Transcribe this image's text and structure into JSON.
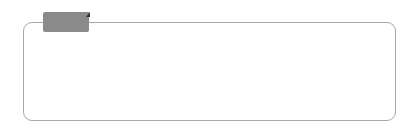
{
  "label": "보기",
  "figures": [
    {
      "number": "3",
      "edges": [
        "top",
        "right",
        "bottom"
      ],
      "x": 56
    },
    {
      "number": "3",
      "edges": [
        "top",
        "left",
        "right"
      ],
      "x": 124
    },
    {
      "number": "2",
      "edges": [
        "left",
        "bottom"
      ],
      "x": 192
    },
    {
      "number": "2",
      "edges": [
        "top",
        "bottom"
      ],
      "x": 259
    },
    {
      "number": "1",
      "edges": [
        "top"
      ],
      "x": 329
    }
  ],
  "colors": {
    "border": "#a8a8a8",
    "tab": "#8a8a8a",
    "dot": "#222222",
    "line": "#888888"
  }
}
